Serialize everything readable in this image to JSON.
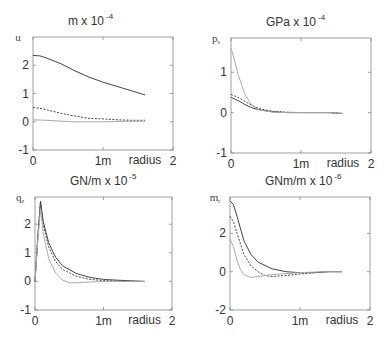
{
  "chart_data": [
    {
      "type": "line",
      "title": "m x 10^-4",
      "title_base": "m x 10",
      "title_exp": "-4",
      "ylabel": "u",
      "ylabel_sub": "",
      "xlabel": "radius",
      "xlim": [
        0,
        2
      ],
      "ylim": [
        -1,
        3
      ],
      "xticks": [
        0,
        1,
        2
      ],
      "xtick_labels": [
        "0",
        "1m",
        "2"
      ],
      "yticks": [
        -1,
        0,
        1,
        2
      ],
      "ytick_labels": [
        "-1",
        "0",
        "1",
        "2"
      ],
      "grid": false,
      "box": {
        "left": 33,
        "top": 37,
        "right": 173,
        "bottom": 150
      },
      "series": [
        {
          "name": "solid-dark",
          "style": "solid",
          "color": "#444444",
          "x": [
            0,
            0.1,
            0.2,
            0.4,
            0.6,
            0.8,
            1.0,
            1.2,
            1.4,
            1.6
          ],
          "y": [
            2.35,
            2.33,
            2.25,
            2.05,
            1.8,
            1.58,
            1.4,
            1.25,
            1.1,
            0.95
          ]
        },
        {
          "name": "dashed-dark",
          "style": "dashed",
          "color": "#444444",
          "x": [
            0,
            0.1,
            0.2,
            0.4,
            0.6,
            0.8,
            1.0,
            1.2,
            1.4,
            1.6
          ],
          "y": [
            0.5,
            0.48,
            0.42,
            0.3,
            0.2,
            0.12,
            0.1,
            0.07,
            0.05,
            0.05
          ]
        },
        {
          "name": "solid-light",
          "style": "solid",
          "color": "#aaaaaa",
          "x": [
            0,
            0.2,
            0.4,
            0.6,
            0.8,
            1.0,
            1.2,
            1.4,
            1.6
          ],
          "y": [
            0.07,
            0.05,
            0.02,
            0.0,
            0.0,
            0.0,
            0.01,
            0.02,
            0.02
          ]
        }
      ]
    },
    {
      "type": "line",
      "title": "GPa x 10^-4",
      "title_base": "GPa x 10",
      "title_exp": "-4",
      "ylabel": "p",
      "ylabel_sub": "s",
      "xlabel": "radius",
      "xlim": [
        0,
        2
      ],
      "ylim": [
        -1,
        1.85
      ],
      "xticks": [
        0,
        1,
        2
      ],
      "xtick_labels": [
        "0",
        "1m",
        "2"
      ],
      "yticks": [
        -1,
        0,
        1
      ],
      "ytick_labels": [
        "-1",
        "0",
        "1"
      ],
      "grid": false,
      "box": {
        "left": 231,
        "top": 38,
        "right": 371,
        "bottom": 153
      },
      "series": [
        {
          "name": "solid-dark",
          "style": "solid",
          "color": "#444444",
          "x": [
            0,
            0.1,
            0.2,
            0.3,
            0.4,
            0.6,
            0.8,
            1.0,
            1.2,
            1.4,
            1.6
          ],
          "y": [
            0.38,
            0.3,
            0.2,
            0.12,
            0.07,
            0.02,
            0.0,
            0.0,
            0.0,
            0.0,
            -0.02
          ]
        },
        {
          "name": "dashed-dark",
          "style": "dashed",
          "color": "#444444",
          "x": [
            0,
            0.1,
            0.2,
            0.3,
            0.4,
            0.6,
            0.8,
            1.0,
            1.2,
            1.4,
            1.6
          ],
          "y": [
            0.45,
            0.38,
            0.28,
            0.18,
            0.1,
            0.03,
            0.01,
            0.0,
            0.0,
            0.0,
            -0.02
          ]
        },
        {
          "name": "solid-light",
          "style": "solid",
          "color": "#aaaaaa",
          "x": [
            0,
            0.05,
            0.1,
            0.15,
            0.2,
            0.3,
            0.4,
            0.6,
            0.8,
            1.0,
            1.2,
            1.4,
            1.6
          ],
          "y": [
            1.6,
            1.3,
            0.95,
            0.7,
            0.45,
            0.18,
            0.07,
            0.01,
            0.0,
            0.0,
            0.0,
            0.0,
            -0.02
          ]
        }
      ]
    },
    {
      "type": "line",
      "title": "GN/m x 10^-5",
      "title_base": "GN/m x 10",
      "title_exp": "-5",
      "ylabel": "q",
      "ylabel_sub": "z",
      "xlabel": "radius",
      "xlim": [
        0,
        2
      ],
      "ylim": [
        -1,
        2.95
      ],
      "xticks": [
        0,
        1,
        2
      ],
      "xtick_labels": [
        "0",
        "1m",
        "2"
      ],
      "yticks": [
        -1,
        0,
        1,
        2
      ],
      "ytick_labels": [
        "-1",
        "0",
        "1",
        "2"
      ],
      "grid": false,
      "box": {
        "left": 35,
        "top": 197,
        "right": 172,
        "bottom": 310
      },
      "series": [
        {
          "name": "solid-dark",
          "style": "solid",
          "color": "#444444",
          "x": [
            0,
            0.04,
            0.08,
            0.12,
            0.2,
            0.3,
            0.4,
            0.6,
            0.8,
            1.0,
            1.2,
            1.4,
            1.6
          ],
          "y": [
            0.0,
            1.5,
            2.8,
            2.1,
            1.35,
            0.85,
            0.55,
            0.28,
            0.14,
            0.07,
            0.04,
            0.02,
            0.0
          ]
        },
        {
          "name": "dashed-dark",
          "style": "dashed",
          "color": "#444444",
          "x": [
            0,
            0.04,
            0.08,
            0.12,
            0.2,
            0.3,
            0.4,
            0.6,
            0.8,
            1.0,
            1.2,
            1.4,
            1.6
          ],
          "y": [
            0.0,
            1.5,
            2.8,
            2.0,
            1.2,
            0.7,
            0.42,
            0.18,
            0.07,
            0.03,
            0.01,
            0.0,
            0.0
          ]
        },
        {
          "name": "solid-light",
          "style": "solid",
          "color": "#aaaaaa",
          "x": [
            0,
            0.04,
            0.08,
            0.12,
            0.2,
            0.3,
            0.4,
            0.5,
            0.6,
            0.8,
            1.0,
            1.2,
            1.4,
            1.6
          ],
          "y": [
            0.0,
            1.4,
            2.55,
            1.7,
            0.8,
            0.3,
            0.05,
            -0.05,
            -0.05,
            -0.02,
            0.0,
            0.0,
            0.0,
            0.0
          ]
        }
      ]
    },
    {
      "type": "line",
      "title": "GNm/m x 10^-6",
      "title_base": "GNm/m x 10",
      "title_exp": "-6",
      "ylabel": "m",
      "ylabel_sub": "r",
      "xlabel": "radius",
      "xlim": [
        0,
        2
      ],
      "ylim": [
        -2,
        3.9
      ],
      "xticks": [
        0,
        1,
        2
      ],
      "xtick_labels": [
        "0",
        "1m",
        "2"
      ],
      "yticks": [
        -2,
        0,
        2
      ],
      "ytick_labels": [
        "-2",
        "0",
        "2"
      ],
      "grid": false,
      "box": {
        "left": 230,
        "top": 197,
        "right": 370,
        "bottom": 310
      },
      "series": [
        {
          "name": "solid-dark",
          "style": "solid",
          "color": "#444444",
          "x": [
            0,
            0.05,
            0.1,
            0.2,
            0.3,
            0.4,
            0.6,
            0.8,
            1.0,
            1.2,
            1.4,
            1.6
          ],
          "y": [
            3.7,
            3.5,
            2.9,
            1.6,
            0.9,
            0.5,
            0.15,
            0.0,
            -0.05,
            -0.05,
            0.0,
            0.0
          ]
        },
        {
          "name": "dashed-dark",
          "style": "dashed",
          "color": "#444444",
          "x": [
            0,
            0.05,
            0.1,
            0.2,
            0.3,
            0.4,
            0.5,
            0.6,
            0.8,
            1.0,
            1.2,
            1.4,
            1.6
          ],
          "y": [
            2.9,
            2.6,
            2.0,
            0.9,
            0.3,
            0.0,
            -0.2,
            -0.25,
            -0.2,
            -0.12,
            -0.05,
            0.0,
            0.0
          ]
        },
        {
          "name": "solid-light",
          "style": "solid",
          "color": "#aaaaaa",
          "x": [
            0,
            0.05,
            0.1,
            0.15,
            0.2,
            0.3,
            0.4,
            0.6,
            0.8,
            1.0,
            1.2,
            1.4,
            1.6
          ],
          "y": [
            1.7,
            1.3,
            0.6,
            0.1,
            -0.15,
            -0.3,
            -0.25,
            -0.15,
            -0.1,
            -0.05,
            -0.02,
            0.0,
            0.0
          ]
        }
      ]
    }
  ]
}
